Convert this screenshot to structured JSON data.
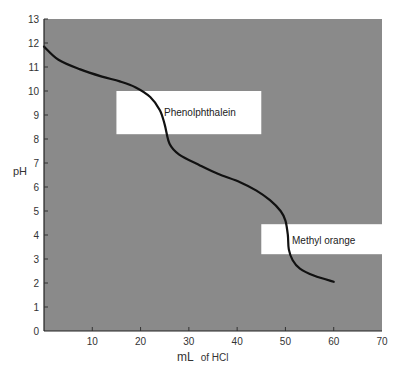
{
  "chart_data": {
    "type": "line",
    "title": "",
    "xlabel_main": "mL",
    "xlabel_suffix": "of HCl",
    "ylabel": "pH",
    "xlim": [
      0,
      70
    ],
    "ylim": [
      0,
      13
    ],
    "x_ticks": [
      10,
      20,
      30,
      40,
      50,
      60,
      70
    ],
    "y_ticks": [
      0,
      1,
      2,
      3,
      4,
      5,
      6,
      7,
      8,
      9,
      10,
      11,
      12,
      13
    ],
    "grid": false,
    "plot_background": "#8a8a8a",
    "curve_color": "#111111",
    "series": [
      {
        "name": "Titration curve",
        "x": [
          0,
          3,
          7.5,
          12,
          15.7,
          19,
          22,
          24,
          25,
          26,
          28,
          32.3,
          36,
          40.6,
          44,
          46.8,
          49,
          50,
          50.5,
          50.7,
          51.5,
          53,
          56,
          60
        ],
        "y": [
          11.85,
          11.3,
          10.9,
          10.6,
          10.4,
          10.15,
          9.75,
          9.2,
          8.6,
          7.8,
          7.35,
          6.9,
          6.55,
          6.2,
          5.85,
          5.45,
          5.0,
          4.6,
          4.0,
          3.4,
          2.95,
          2.6,
          2.3,
          2.05
        ]
      }
    ],
    "annotations": [
      {
        "label": "Phenolphthalein",
        "x0": 15,
        "x1": 45,
        "y0": 8.2,
        "y1": 10.0,
        "fill": "#ffffff"
      },
      {
        "label": "Methyl orange",
        "x0": 45,
        "x1": 70,
        "y0": 3.2,
        "y1": 4.45,
        "fill": "#ffffff"
      }
    ]
  }
}
